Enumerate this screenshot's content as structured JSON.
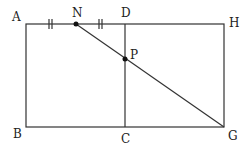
{
  "diagram": {
    "points": {
      "A": {
        "label": "A",
        "x": 26,
        "y": 24
      },
      "D": {
        "label": "D",
        "x": 125,
        "y": 24
      },
      "H": {
        "label": "H",
        "x": 224,
        "y": 24
      },
      "B": {
        "label": "B",
        "x": 26,
        "y": 127
      },
      "C": {
        "label": "C",
        "x": 125,
        "y": 127
      },
      "G": {
        "label": "G",
        "x": 224,
        "y": 127
      },
      "N": {
        "label": "N",
        "x": 76,
        "y": 24
      },
      "P": {
        "label": "P",
        "x": 125,
        "y": 59
      }
    },
    "segments": [
      "AH",
      "HG",
      "GB",
      "BA",
      "DC",
      "NG"
    ],
    "tick_marks": [
      {
        "segment": "AN",
        "marks": 2
      },
      {
        "segment": "ND",
        "marks": 2
      }
    ],
    "marked_points": [
      "N",
      "P"
    ],
    "stroke_color": "#333333"
  }
}
